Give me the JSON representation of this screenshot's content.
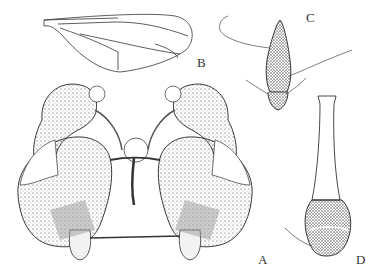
{
  "figure": {
    "panels": [
      {
        "id": "A",
        "label": "A",
        "description": "male genitalia, ventral view"
      },
      {
        "id": "B",
        "label": "B",
        "description": "wing"
      },
      {
        "id": "C",
        "label": "C",
        "description": "spine-like appendage"
      },
      {
        "id": "D",
        "label": "D",
        "description": "stalked structure with setose base"
      }
    ],
    "colors": {
      "ink": "#222222",
      "paper": "#ffffff",
      "shade": "#888888"
    }
  }
}
